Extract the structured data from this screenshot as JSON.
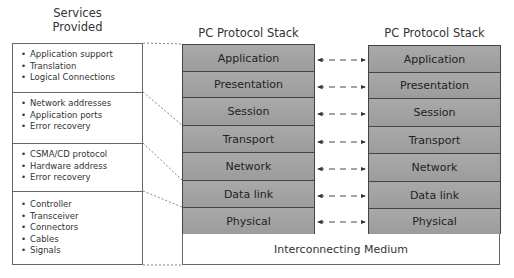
{
  "services": {
    "title_line1": "Services",
    "title_line2": "Provided",
    "groups": [
      {
        "items": [
          "Application support",
          "Translation",
          "Logical Connections"
        ]
      },
      {
        "items": [
          "Network addresses",
          "Application ports",
          "Error recovery"
        ]
      },
      {
        "items": [
          "CSMA/CD protocol",
          "Hardware address",
          "Error recovery"
        ]
      },
      {
        "items": [
          "Controller",
          "Transceiver",
          "Connectors",
          "Cables",
          "Signals"
        ]
      }
    ]
  },
  "left_stack": {
    "title": "PC Protocol Stack",
    "layers": [
      "Application",
      "Presentation",
      "Session",
      "Transport",
      "Network",
      "Data link",
      "Physical"
    ]
  },
  "right_stack": {
    "title": "PC Protocol Stack",
    "layers": [
      "Application",
      "Presentation",
      "Session",
      "Transport",
      "Network",
      "Data link",
      "Physical"
    ]
  },
  "medium": {
    "label": "Interconnecting Medium"
  },
  "colors": {
    "layer_fill": "#a3a3a3",
    "border": "#444444",
    "line": "#555555"
  }
}
